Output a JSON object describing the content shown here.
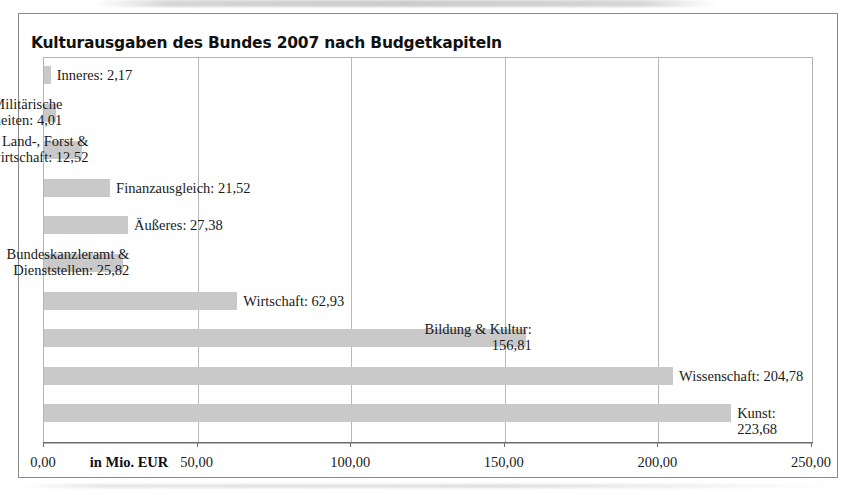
{
  "chart_data": {
    "type": "bar",
    "orientation": "horizontal",
    "title": "Kulturausgaben des Bundes 2007 nach Budgetkapiteln",
    "xlabel": "in Mio. EUR",
    "ylabel": "",
    "xlim": [
      0,
      250
    ],
    "xticks": [
      0,
      50,
      100,
      150,
      200,
      250
    ],
    "xtick_labels": [
      "0,00",
      "50,00",
      "100,00",
      "150,00",
      "200,00",
      "250,00"
    ],
    "grid": true,
    "legend": "none",
    "bar_color": "#c9c9c9",
    "categories": [
      "Inneres",
      "Militärische Angelegenheiten",
      "Land-, Forst & Wasserwirtschaft",
      "Finanzausgleich",
      "Äußeres",
      "Bundeskanzleramt & Dienststellen",
      "Wirtschaft",
      "Bildung & Kultur",
      "Wissenschaft",
      "Kunst"
    ],
    "values": [
      2.17,
      4.01,
      12.52,
      21.52,
      27.38,
      25.82,
      62.93,
      156.81,
      204.78,
      223.68
    ],
    "value_labels": [
      "2,17",
      "4,01",
      "12,52",
      "21,52",
      "27,38",
      "25,82",
      "62,93",
      "156,81",
      "204,78",
      "223,68"
    ],
    "bars": [
      {
        "category": "Inneres",
        "value": 2.17,
        "label": "Inneres: 2,17",
        "label_lines": 1
      },
      {
        "category": "Militärische Angelegenheiten",
        "value": 4.01,
        "label": "Militärische\nAngelegenheiten: 4,01",
        "label_lines": 2
      },
      {
        "category": "Land-, Forst & Wasserwirtschaft",
        "value": 12.52,
        "label": "Land-, Forst &\nWasserwirtschaft: 12,52",
        "label_lines": 2
      },
      {
        "category": "Finanzausgleich",
        "value": 21.52,
        "label": "Finanzausgleich: 21,52",
        "label_lines": 1
      },
      {
        "category": "Äußeres",
        "value": 27.38,
        "label": "Äußeres: 27,38",
        "label_lines": 1
      },
      {
        "category": "Bundeskanzleramt & Dienststellen",
        "value": 25.82,
        "label": "Bundeskanzleramt &\nDienststellen: 25,82",
        "label_lines": 2
      },
      {
        "category": "Wirtschaft",
        "value": 62.93,
        "label": "Wirtschaft: 62,93",
        "label_lines": 1
      },
      {
        "category": "Bildung & Kultur",
        "value": 156.81,
        "label": "Bildung & Kultur:\n156,81",
        "label_lines": 2
      },
      {
        "category": "Wissenschaft",
        "value": 204.78,
        "label": "Wissenschaft: 204,78",
        "label_lines": 1
      },
      {
        "category": "Kunst",
        "value": 223.68,
        "label": "Kunst: 223,68",
        "label_lines": 1
      }
    ]
  }
}
